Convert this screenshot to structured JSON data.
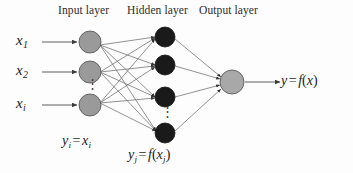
{
  "figure": {
    "background_color": "#fdfdfd",
    "width": 353,
    "height": 173
  },
  "layer_titles": {
    "input": "Input layer",
    "hidden": "Hidden layer",
    "output": "Output layer"
  },
  "colors": {
    "input_node": "#9a9a9a",
    "hidden_node": "#1a1a1a",
    "output_node": "#a8a8a8",
    "node_stroke": "#555555",
    "edge": "#6e6e6e",
    "text": "#1c1c1c"
  },
  "input_labels": [
    {
      "base": "x",
      "sub": "1"
    },
    {
      "base": "x",
      "sub": "2"
    },
    {
      "base": "x",
      "sub": "i"
    }
  ],
  "equations": {
    "input_layer": {
      "lhs_base": "y",
      "lhs_sub": "i",
      "op": "=",
      "rhs_base": "x",
      "rhs_sub": "i",
      "text": "y_i = x_i"
    },
    "hidden_layer": {
      "lhs_base": "y",
      "lhs_sub": "j",
      "op": "=",
      "fn": "f",
      "arg_base": "x",
      "arg_sub": "j",
      "text": "y_j = f(x_j)"
    },
    "output": {
      "lhs_base": "y",
      "op": "=",
      "fn": "f",
      "arg_base": "x",
      "text": "y = f(x)"
    }
  },
  "ellipsis_glyph": "⋮",
  "network": {
    "input_nodes": [
      {
        "id": "in-1",
        "cx": 90,
        "cy": 42,
        "r": 11
      },
      {
        "id": "in-2",
        "cx": 90,
        "cy": 72,
        "r": 11
      },
      {
        "id": "in-3",
        "cx": 90,
        "cy": 105,
        "r": 11
      }
    ],
    "hidden_nodes": [
      {
        "id": "hid-1",
        "cx": 165,
        "cy": 37,
        "r": 10
      },
      {
        "id": "hid-2",
        "cx": 165,
        "cy": 65,
        "r": 10
      },
      {
        "id": "hid-3",
        "cx": 165,
        "cy": 97,
        "r": 10
      },
      {
        "id": "hid-4",
        "cx": 165,
        "cy": 133,
        "r": 10
      }
    ],
    "output_nodes": [
      {
        "id": "out-1",
        "cx": 232,
        "cy": 82,
        "r": 12
      }
    ],
    "input_arrows": [
      {
        "x1": 42,
        "y1": 42,
        "x2": 77,
        "y2": 42
      },
      {
        "x1": 42,
        "y1": 72,
        "x2": 77,
        "y2": 72
      },
      {
        "x1": 42,
        "y1": 105,
        "x2": 77,
        "y2": 105
      }
    ],
    "output_arrow": {
      "x1": 245,
      "y1": 82,
      "x2": 280,
      "y2": 82
    }
  }
}
